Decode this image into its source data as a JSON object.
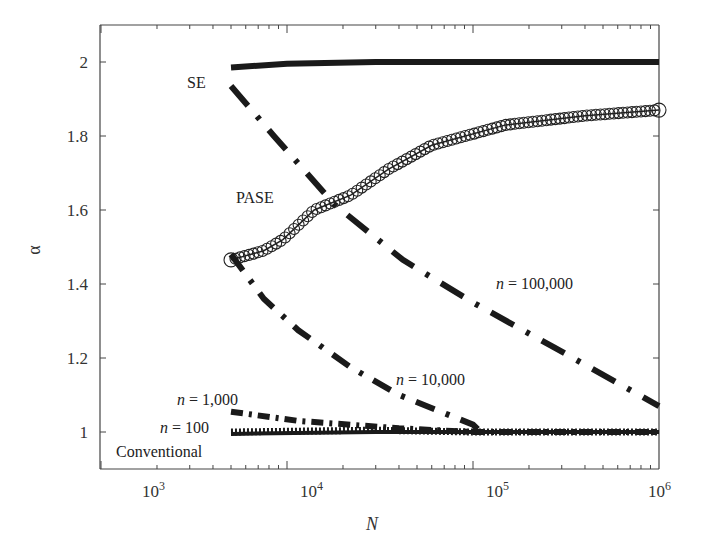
{
  "chart_data": {
    "type": "line",
    "title": "",
    "xlabel": "N",
    "ylabel": "α",
    "xscale": "log",
    "xlim": [
      1000,
      1000000
    ],
    "ylim": [
      0.9,
      2.1
    ],
    "grid": false,
    "legend": "none (inline annotations)",
    "x_ticks": [
      {
        "label_base": "10",
        "label_exp": "3",
        "value": 1000
      },
      {
        "label_base": "10",
        "label_exp": "4",
        "value": 10000
      },
      {
        "label_base": "10",
        "label_exp": "5",
        "value": 100000
      },
      {
        "label_base": "10",
        "label_exp": "6",
        "value": 1000000
      }
    ],
    "y_ticks": [
      "1",
      "1.2",
      "1.4",
      "1.6",
      "1.8",
      "2"
    ],
    "series": [
      {
        "name": "SE",
        "style": "solid-thick",
        "x": [
          5000,
          10000,
          30000,
          100000,
          300000,
          1000000
        ],
        "values": [
          1.985,
          1.995,
          2.0,
          2.0,
          2.0,
          2.0
        ]
      },
      {
        "name": "n = 100,000",
        "style": "dash-dot",
        "x": [
          5000,
          8500,
          18000,
          42000,
          100000,
          270000,
          1000000
        ],
        "values": [
          1.935,
          1.8,
          1.615,
          1.465,
          1.35,
          1.23,
          1.07
        ]
      },
      {
        "name": "PASE",
        "style": "circles",
        "x": [
          5000,
          7500,
          9500,
          14000,
          22000,
          35000,
          60000,
          150000,
          400000,
          1000000
        ],
        "values": [
          1.465,
          1.49,
          1.52,
          1.6,
          1.64,
          1.71,
          1.775,
          1.83,
          1.855,
          1.87
        ]
      },
      {
        "name": "n = 10,000",
        "style": "dash-dot",
        "x": [
          5000,
          7500,
          11500,
          22000,
          40000,
          100000,
          110000
        ],
        "values": [
          1.48,
          1.36,
          1.275,
          1.175,
          1.1,
          1.02,
          1.0
        ]
      },
      {
        "name": "n = 1,000",
        "style": "dash-dot-fine",
        "x": [
          5000,
          11500,
          40000,
          100000,
          1000000
        ],
        "values": [
          1.055,
          1.03,
          1.01,
          1.0,
          1.0
        ]
      },
      {
        "name": "n = 100",
        "style": "dotted-thick",
        "x": [
          5000,
          30000,
          100000,
          1000000
        ],
        "values": [
          1.0,
          1.005,
          1.0,
          1.0
        ]
      },
      {
        "name": "Conventional",
        "style": "solid",
        "x": [
          5000,
          30000,
          100000,
          1000000
        ],
        "values": [
          0.995,
          1.0,
          1.0,
          1.0
        ]
      }
    ],
    "annotations": [
      {
        "text": "SE",
        "italic": false
      },
      {
        "text": "PASE",
        "italic": false
      },
      {
        "text_var": "n",
        "text_rest": " = 100,000"
      },
      {
        "text_var": "n",
        "text_rest": " = 10,000"
      },
      {
        "text_var": "n",
        "text_rest": " = 1,000"
      },
      {
        "text_var": "n",
        "text_rest": " = 100"
      },
      {
        "text": "Conventional",
        "italic": false
      }
    ]
  }
}
